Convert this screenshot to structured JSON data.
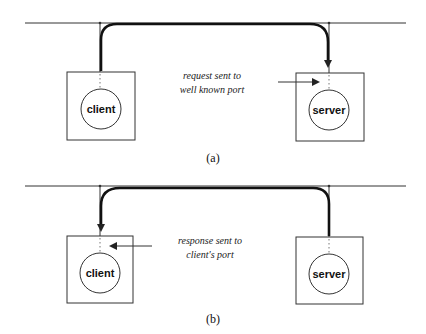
{
  "diagram": {
    "type": "client-server port communication",
    "colors": {
      "line": "#222222",
      "background": "#ffffff"
    },
    "panels": [
      {
        "id": "a",
        "caption": "(a)",
        "network_line": "shared network",
        "nodes": [
          {
            "label": "client"
          },
          {
            "label": "server"
          }
        ],
        "flow": {
          "from": "client",
          "to": "server"
        },
        "annotation": {
          "line1": "request sent to",
          "line2": "well known port",
          "points_to": "server"
        }
      },
      {
        "id": "b",
        "caption": "(b)",
        "network_line": "shared network",
        "nodes": [
          {
            "label": "client"
          },
          {
            "label": "server"
          }
        ],
        "flow": {
          "from": "server",
          "to": "client"
        },
        "annotation": {
          "line1": "response sent to",
          "line2": "client's port",
          "points_to": "client"
        }
      }
    ]
  }
}
